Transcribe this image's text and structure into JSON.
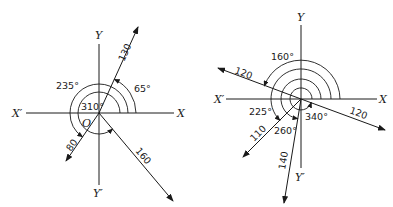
{
  "diagrams": [
    {
      "name": "left",
      "origin_label": "O",
      "axes": {
        "x_pos": "X",
        "x_neg": "X′",
        "y_pos": "Y",
        "y_neg": "Y′"
      },
      "vectors": [
        {
          "magnitude": "130",
          "angle": "65°"
        },
        {
          "magnitude": "80",
          "angle": "235°"
        },
        {
          "magnitude": "160",
          "angle": "310°"
        }
      ]
    },
    {
      "name": "right",
      "axes": {
        "x_pos": "X",
        "x_neg": "X′",
        "y_pos": "Y",
        "y_neg": "Y′"
      },
      "vectors": [
        {
          "magnitude": "120",
          "angle": "160°"
        },
        {
          "magnitude": "110",
          "angle": "225°"
        },
        {
          "magnitude": "140",
          "angle": "260°"
        },
        {
          "magnitude": "120",
          "angle": "340°"
        }
      ]
    }
  ]
}
